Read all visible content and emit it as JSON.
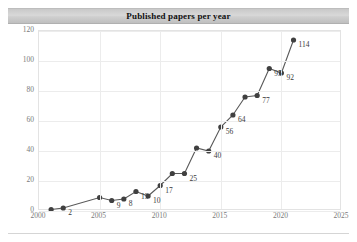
{
  "chart_data": {
    "type": "line",
    "title": "Published papers per year",
    "xlabel": "",
    "ylabel": "",
    "xlim": [
      2000,
      2025
    ],
    "ylim": [
      0,
      120
    ],
    "grid": true,
    "legend": "none",
    "marker": "filled-circle",
    "line_color": "#595959",
    "marker_color": "#404040",
    "xticks": [
      "2000",
      "2005",
      "2010",
      "2015",
      "2020",
      "2025"
    ],
    "yticks": [
      "0",
      "20",
      "40",
      "60",
      "80",
      "100",
      "120"
    ],
    "x": [
      2001,
      2002,
      2005,
      2006,
      2007,
      2008,
      2009,
      2010,
      2011,
      2012,
      2013,
      2014,
      2015,
      2016,
      2017,
      2018,
      2019,
      2020,
      2021
    ],
    "values": [
      1,
      2,
      9,
      7,
      8,
      13,
      10,
      17,
      25,
      25,
      42,
      40,
      56,
      64,
      76,
      77,
      95,
      92,
      114
    ],
    "point_labels": [
      {
        "x": 2002,
        "y": 2,
        "text": "2"
      },
      {
        "x": 2006,
        "y": 7,
        "text": "9"
      },
      {
        "x": 2007,
        "y": 8,
        "text": "8"
      },
      {
        "x": 2008,
        "y": 13,
        "text": "13"
      },
      {
        "x": 2009,
        "y": 10,
        "text": "10"
      },
      {
        "x": 2010,
        "y": 17,
        "text": "17"
      },
      {
        "x": 2012,
        "y": 25,
        "text": "25"
      },
      {
        "x": 2014,
        "y": 40,
        "text": "40"
      },
      {
        "x": 2015,
        "y": 56,
        "text": "56"
      },
      {
        "x": 2016,
        "y": 64,
        "text": "64"
      },
      {
        "x": 2018,
        "y": 77,
        "text": "77"
      },
      {
        "x": 2019,
        "y": 95,
        "text": "95"
      },
      {
        "x": 2020,
        "y": 92,
        "text": "92"
      },
      {
        "x": 2021,
        "y": 114,
        "text": "114"
      }
    ]
  }
}
